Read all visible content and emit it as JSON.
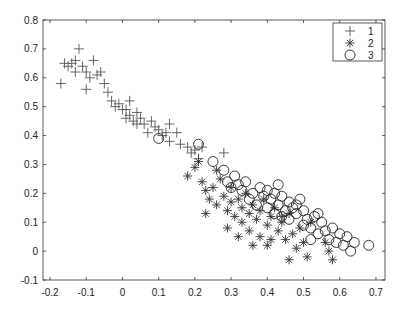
{
  "chart_data": {
    "type": "scatter",
    "title": "",
    "xlabel": "",
    "ylabel": "",
    "xlim": [
      -0.22,
      0.74
    ],
    "ylim": [
      -0.1,
      0.8
    ],
    "xticks": [
      -0.2,
      -0.1,
      0,
      0.1,
      0.2,
      0.3,
      0.4,
      0.5,
      0.6,
      0.7
    ],
    "xtick_labels": [
      "-0.2",
      "-0.1",
      "0",
      "0.1",
      "0.2",
      "0.3",
      "0.4",
      "0.5",
      "0.6",
      "0.7"
    ],
    "yticks": [
      -0.1,
      0,
      0.1,
      0.2,
      0.3,
      0.4,
      0.5,
      0.6,
      0.7,
      0.8
    ],
    "ytick_labels": [
      "-0.1",
      "0",
      "0.1",
      "0.2",
      "0.3",
      "0.4",
      "0.5",
      "0.6",
      "0.7",
      "0.8"
    ],
    "grid": false,
    "legend_position": "upper right",
    "series": [
      {
        "name": "1",
        "marker": "+",
        "color": "#555555",
        "points": [
          [
            -0.17,
            0.58
          ],
          [
            -0.16,
            0.65
          ],
          [
            -0.15,
            0.64
          ],
          [
            -0.14,
            0.65
          ],
          [
            -0.13,
            0.66
          ],
          [
            -0.12,
            0.7
          ],
          [
            -0.11,
            0.64
          ],
          [
            -0.1,
            0.62
          ],
          [
            -0.09,
            0.6
          ],
          [
            -0.1,
            0.56
          ],
          [
            -0.08,
            0.66
          ],
          [
            -0.07,
            0.61
          ],
          [
            -0.06,
            0.62
          ],
          [
            -0.05,
            0.58
          ],
          [
            -0.04,
            0.55
          ],
          [
            -0.03,
            0.52
          ],
          [
            -0.02,
            0.5
          ],
          [
            -0.01,
            0.51
          ],
          [
            0.0,
            0.49
          ],
          [
            0.01,
            0.46
          ],
          [
            0.02,
            0.52
          ],
          [
            0.02,
            0.47
          ],
          [
            0.03,
            0.45
          ],
          [
            0.04,
            0.44
          ],
          [
            0.04,
            0.48
          ],
          [
            0.05,
            0.46
          ],
          [
            0.06,
            0.44
          ],
          [
            0.07,
            0.41
          ],
          [
            0.08,
            0.45
          ],
          [
            0.09,
            0.43
          ],
          [
            0.1,
            0.42
          ],
          [
            0.11,
            0.4
          ],
          [
            0.12,
            0.41
          ],
          [
            0.13,
            0.38
          ],
          [
            0.15,
            0.41
          ],
          [
            0.16,
            0.37
          ],
          [
            0.18,
            0.36
          ],
          [
            0.19,
            0.34
          ],
          [
            0.2,
            0.35
          ],
          [
            0.21,
            0.32
          ],
          [
            0.22,
            0.36
          ],
          [
            0.28,
            0.34
          ],
          [
            0.13,
            0.44
          ],
          [
            0.01,
            0.49
          ],
          [
            -0.13,
            0.62
          ]
        ]
      },
      {
        "name": "2",
        "marker": "*",
        "color": "#333333",
        "points": [
          [
            0.18,
            0.26
          ],
          [
            0.2,
            0.29
          ],
          [
            0.21,
            0.31
          ],
          [
            0.22,
            0.24
          ],
          [
            0.23,
            0.21
          ],
          [
            0.24,
            0.18
          ],
          [
            0.25,
            0.22
          ],
          [
            0.26,
            0.28
          ],
          [
            0.27,
            0.25
          ],
          [
            0.26,
            0.16
          ],
          [
            0.28,
            0.19
          ],
          [
            0.29,
            0.14
          ],
          [
            0.3,
            0.22
          ],
          [
            0.3,
            0.17
          ],
          [
            0.31,
            0.12
          ],
          [
            0.32,
            0.18
          ],
          [
            0.33,
            0.1
          ],
          [
            0.33,
            0.15
          ],
          [
            0.34,
            0.2
          ],
          [
            0.35,
            0.13
          ],
          [
            0.35,
            0.07
          ],
          [
            0.36,
            0.16
          ],
          [
            0.37,
            0.11
          ],
          [
            0.38,
            0.05
          ],
          [
            0.38,
            0.14
          ],
          [
            0.39,
            0.18
          ],
          [
            0.4,
            0.09
          ],
          [
            0.41,
            0.12
          ],
          [
            0.41,
            0.04
          ],
          [
            0.42,
            0.15
          ],
          [
            0.43,
            0.07
          ],
          [
            0.44,
            0.1
          ],
          [
            0.44,
            0.12
          ],
          [
            0.45,
            0.04
          ],
          [
            0.46,
            0.13
          ],
          [
            0.47,
            0.06
          ],
          [
            0.48,
            0.01
          ],
          [
            0.49,
            0.08
          ],
          [
            0.5,
            0.03
          ],
          [
            0.51,
            -0.02
          ],
          [
            0.52,
            0.1
          ],
          [
            0.56,
            0.03
          ],
          [
            0.57,
            0.0
          ],
          [
            0.58,
            -0.03
          ],
          [
            0.46,
            -0.03
          ],
          [
            0.36,
            0.02
          ],
          [
            0.29,
            0.08
          ],
          [
            0.23,
            0.13
          ],
          [
            0.32,
            0.05
          ],
          [
            0.4,
            0.02
          ]
        ]
      },
      {
        "name": "3",
        "marker": "o",
        "color": "#222222",
        "points": [
          [
            0.1,
            0.39
          ],
          [
            0.21,
            0.37
          ],
          [
            0.25,
            0.31
          ],
          [
            0.28,
            0.28
          ],
          [
            0.29,
            0.24
          ],
          [
            0.3,
            0.22
          ],
          [
            0.31,
            0.26
          ],
          [
            0.32,
            0.23
          ],
          [
            0.33,
            0.21
          ],
          [
            0.34,
            0.24
          ],
          [
            0.35,
            0.18
          ],
          [
            0.36,
            0.2
          ],
          [
            0.37,
            0.16
          ],
          [
            0.38,
            0.22
          ],
          [
            0.39,
            0.19
          ],
          [
            0.4,
            0.21
          ],
          [
            0.4,
            0.15
          ],
          [
            0.41,
            0.18
          ],
          [
            0.42,
            0.13
          ],
          [
            0.42,
            0.2
          ],
          [
            0.43,
            0.16
          ],
          [
            0.44,
            0.12
          ],
          [
            0.44,
            0.19
          ],
          [
            0.45,
            0.14
          ],
          [
            0.46,
            0.17
          ],
          [
            0.46,
            0.11
          ],
          [
            0.47,
            0.15
          ],
          [
            0.48,
            0.13
          ],
          [
            0.49,
            0.18
          ],
          [
            0.5,
            0.14
          ],
          [
            0.5,
            0.09
          ],
          [
            0.51,
            0.11
          ],
          [
            0.52,
            0.08
          ],
          [
            0.53,
            0.12
          ],
          [
            0.54,
            0.06
          ],
          [
            0.55,
            0.1
          ],
          [
            0.56,
            0.07
          ],
          [
            0.57,
            0.04
          ],
          [
            0.58,
            0.08
          ],
          [
            0.59,
            0.03
          ],
          [
            0.6,
            0.06
          ],
          [
            0.61,
            0.02
          ],
          [
            0.62,
            0.05
          ],
          [
            0.63,
            0.0
          ],
          [
            0.64,
            0.03
          ],
          [
            0.68,
            0.02
          ],
          [
            0.52,
            0.04
          ],
          [
            0.54,
            0.13
          ],
          [
            0.48,
            0.16
          ],
          [
            0.43,
            0.23
          ]
        ]
      }
    ]
  }
}
